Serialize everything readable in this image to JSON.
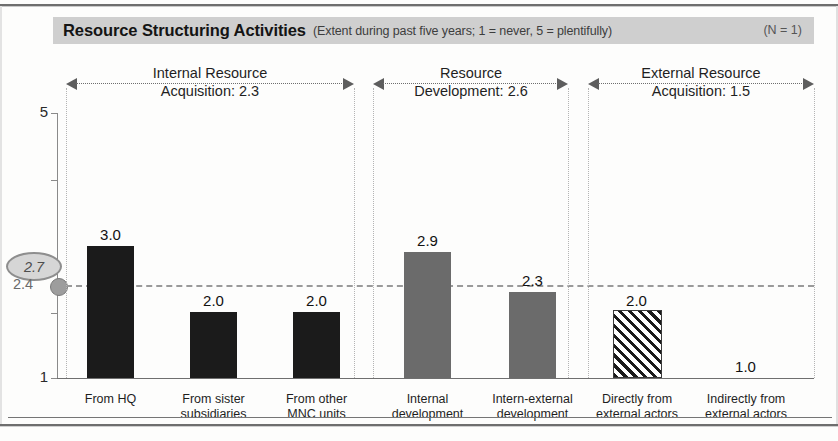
{
  "header": {
    "title": "Resource Structuring Activities",
    "subtitle": "(Extent during past five years; 1 = never, 5 = plentifully)",
    "sample_size": "(N = 1)"
  },
  "markers": {
    "badge_value": "2.7",
    "reference_value": "2.4"
  },
  "chart_data": {
    "type": "bar",
    "title": "Resource Structuring Activities",
    "subtitle": "(Extent during past five years; 1 = never, 5 = plentifully)",
    "xlabel": "",
    "ylabel": "",
    "ylim": [
      1,
      5
    ],
    "yticks": [
      "1",
      "5"
    ],
    "grid": false,
    "legend": "none",
    "reference_line": 2.4,
    "highlight_badge": 2.7,
    "categories": [
      "From HQ",
      "From sister subsidiaries",
      "From other MNC units",
      "Internal development",
      "Intern-external development",
      "Directly from external actors",
      "Indirectly from external actors"
    ],
    "values": [
      3.0,
      2.0,
      2.0,
      2.9,
      2.3,
      2.0,
      1.0
    ],
    "value_labels": [
      "3.0",
      "2.0",
      "2.0",
      "2.9",
      "2.3",
      "2.0",
      "1.0"
    ],
    "bar_styles": [
      "solid-black",
      "solid-black",
      "solid-black",
      "solid-grey",
      "solid-grey",
      "hatched",
      "none"
    ],
    "groups": [
      {
        "name": "Internal Resource Acquisition",
        "mean": "2.3",
        "title_line1": "Internal Resource",
        "title_line2": "Acquisition: 2.3",
        "members": [
          0,
          1,
          2
        ]
      },
      {
        "name": "Resource Development",
        "mean": "2.6",
        "title_line1": "Resource",
        "title_line2": "Development: 2.6",
        "members": [
          3,
          4
        ]
      },
      {
        "name": "External Resource Acquisition",
        "mean": "1.5",
        "title_line1": "External Resource",
        "title_line2": "Acquisition: 1.5",
        "members": [
          5,
          6
        ]
      }
    ]
  },
  "x_labels": [
    {
      "line1": "From HQ",
      "line2": ""
    },
    {
      "line1": "From sister",
      "line2": "subsidiaries"
    },
    {
      "line1": "From other",
      "line2": "MNC units"
    },
    {
      "line1": "Internal",
      "line2": "development"
    },
    {
      "line1": "Intern-external",
      "line2": "development"
    },
    {
      "line1": "Directly from",
      "line2": "external actors"
    },
    {
      "line1": "Indirectly from",
      "line2": "external actors"
    }
  ],
  "colors": {
    "bar_black": "#1b1b1b",
    "bar_grey": "#6b6b6b",
    "banner": "#cfcfcf",
    "marker": "#9d9d9d"
  }
}
